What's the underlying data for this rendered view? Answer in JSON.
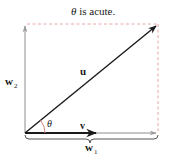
{
  "title": {
    "theta": "θ",
    "text": " is acute."
  },
  "labels": {
    "u": "u",
    "v": "v",
    "w2_base": "w",
    "w2_sub": "2",
    "w1_base": "w",
    "w1_sub": "1",
    "theta": "θ"
  },
  "colors": {
    "vector": "#1a1a1a",
    "component": "#8c8c8c",
    "dashed": "#e8a6a6",
    "angle_arc": "#d98080",
    "brace": "#555555"
  },
  "geometry": {
    "origin": [
      25,
      133
    ],
    "u_tip": [
      157,
      25
    ],
    "v_tip": [
      96,
      133
    ],
    "w1_tip": [
      156,
      133
    ],
    "w2_tip": [
      25,
      25
    ]
  }
}
